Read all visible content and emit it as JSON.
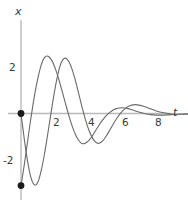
{
  "chart_data": {
    "type": "line",
    "title": "",
    "xlabel": "t",
    "ylabel": "x",
    "xlim": [
      -0.55,
      9.6
    ],
    "ylim": [
      -3.9,
      3.0
    ],
    "grid": false,
    "legend": null,
    "axis_labels": {
      "x_axis": "t",
      "y_axis": "x"
    },
    "xticks": [
      2,
      4,
      6,
      8
    ],
    "xtick_labels": [
      "2",
      "4",
      "6",
      "8"
    ],
    "yticks": [
      2,
      -2
    ],
    "ytick_labels": [
      "2",
      "-2"
    ],
    "annotations": [
      {
        "name": "initial-condition-dot-1",
        "t": 0,
        "x": 0
      },
      {
        "name": "initial-condition-dot-2",
        "t": 0,
        "x": -3.1
      }
    ],
    "series": [
      {
        "name": "solution-curve-1",
        "color": "#6a6a6a",
        "initial_t": 0,
        "initial_x": 0,
        "points": [
          [
            0.0,
            0.0
          ],
          [
            0.1,
            -0.62
          ],
          [
            0.2,
            -1.21
          ],
          [
            0.3,
            -1.75
          ],
          [
            0.4,
            -2.22
          ],
          [
            0.5,
            -2.61
          ],
          [
            0.58,
            -2.84
          ],
          [
            0.66,
            -2.99
          ],
          [
            0.74,
            -3.07
          ],
          [
            0.82,
            -3.07
          ],
          [
            0.9,
            -3.0
          ],
          [
            1.0,
            -2.8
          ],
          [
            1.15,
            -2.33
          ],
          [
            1.3,
            -1.71
          ],
          [
            1.45,
            -1.0
          ],
          [
            1.6,
            -0.25
          ],
          [
            1.75,
            0.5
          ],
          [
            1.9,
            1.18
          ],
          [
            2.05,
            1.75
          ],
          [
            2.2,
            2.16
          ],
          [
            2.32,
            2.33
          ],
          [
            2.42,
            2.38
          ],
          [
            2.52,
            2.35
          ],
          [
            2.65,
            2.21
          ],
          [
            2.8,
            1.93
          ],
          [
            2.95,
            1.55
          ],
          [
            3.15,
            0.95
          ],
          [
            3.35,
            0.32
          ],
          [
            3.55,
            -0.26
          ],
          [
            3.75,
            -0.73
          ],
          [
            3.95,
            -1.07
          ],
          [
            4.1,
            -1.22
          ],
          [
            4.22,
            -1.28
          ],
          [
            4.34,
            -1.27
          ],
          [
            4.5,
            -1.18
          ],
          [
            4.7,
            -0.97
          ],
          [
            4.9,
            -0.7
          ],
          [
            5.1,
            -0.43
          ],
          [
            5.3,
            -0.18
          ],
          [
            5.5,
            0.03
          ],
          [
            5.7,
            0.19
          ],
          [
            5.9,
            0.3
          ],
          [
            6.1,
            0.36
          ],
          [
            6.3,
            0.38
          ],
          [
            6.5,
            0.36
          ],
          [
            6.75,
            0.31
          ],
          [
            7.0,
            0.24
          ],
          [
            7.25,
            0.17
          ],
          [
            7.5,
            0.1
          ],
          [
            7.8,
            0.04
          ],
          [
            8.1,
            0.0
          ],
          [
            8.4,
            -0.02
          ],
          [
            8.8,
            -0.03
          ],
          [
            9.2,
            -0.03
          ],
          [
            9.55,
            -0.02
          ]
        ]
      },
      {
        "name": "solution-curve-2",
        "color": "#6a6a6a",
        "initial_t": 0,
        "initial_x": -3.1,
        "points": [
          [
            0.0,
            -3.1
          ],
          [
            0.1,
            -2.62
          ],
          [
            0.2,
            -2.1
          ],
          [
            0.3,
            -1.55
          ],
          [
            0.42,
            -0.88
          ],
          [
            0.55,
            -0.18
          ],
          [
            0.68,
            0.48
          ],
          [
            0.82,
            1.1
          ],
          [
            0.96,
            1.63
          ],
          [
            1.1,
            2.05
          ],
          [
            1.22,
            2.3
          ],
          [
            1.32,
            2.42
          ],
          [
            1.42,
            2.47
          ],
          [
            1.52,
            2.45
          ],
          [
            1.64,
            2.35
          ],
          [
            1.78,
            2.15
          ],
          [
            1.94,
            1.82
          ],
          [
            2.1,
            1.42
          ],
          [
            2.28,
            0.92
          ],
          [
            2.46,
            0.4
          ],
          [
            2.64,
            -0.1
          ],
          [
            2.82,
            -0.54
          ],
          [
            3.0,
            -0.9
          ],
          [
            3.16,
            -1.13
          ],
          [
            3.3,
            -1.26
          ],
          [
            3.42,
            -1.3
          ],
          [
            3.54,
            -1.28
          ],
          [
            3.7,
            -1.19
          ],
          [
            3.88,
            -1.02
          ],
          [
            4.06,
            -0.8
          ],
          [
            4.26,
            -0.55
          ],
          [
            4.46,
            -0.32
          ],
          [
            4.66,
            -0.12
          ],
          [
            4.86,
            0.03
          ],
          [
            5.06,
            0.14
          ],
          [
            5.26,
            0.21
          ],
          [
            5.4,
            0.24
          ],
          [
            5.55,
            0.25
          ],
          [
            5.72,
            0.24
          ],
          [
            5.9,
            0.21
          ],
          [
            6.15,
            0.15
          ],
          [
            6.4,
            0.09
          ],
          [
            6.65,
            0.03
          ],
          [
            6.9,
            -0.02
          ],
          [
            7.15,
            -0.05
          ],
          [
            7.45,
            -0.07
          ],
          [
            7.75,
            -0.07
          ],
          [
            8.05,
            -0.06
          ],
          [
            8.4,
            -0.04
          ],
          [
            8.8,
            -0.02
          ],
          [
            9.2,
            -0.01
          ],
          [
            9.55,
            0.0
          ]
        ]
      }
    ],
    "axis_color": "#b9b9b9",
    "curve_color": "#6a6a6a",
    "dot_color": "#1a1a1a",
    "background_color": "#ffffff"
  }
}
